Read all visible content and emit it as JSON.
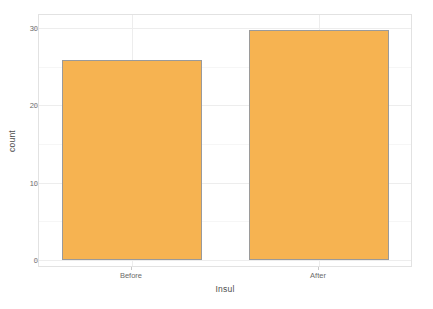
{
  "chart_data": {
    "type": "bar",
    "title": "",
    "subtitle": "",
    "xlabel": "Insul",
    "ylabel": "count",
    "categories": [
      "Before",
      "After"
    ],
    "values": [
      26,
      30
    ],
    "series": [
      {
        "name": "count",
        "values": [
          26,
          30
        ]
      }
    ],
    "ylim": [
      0,
      31
    ],
    "yticks": [
      0,
      10,
      20,
      30
    ],
    "ytick_labels": [
      "0",
      "10",
      "20",
      "30"
    ],
    "xtick_labels": [
      "Before",
      "After"
    ],
    "grid": true,
    "grid_axis": "both",
    "legend": "none",
    "bar_fill_color": "#F6B351",
    "bar_border_color": "#9A9A9A",
    "panel_background": "#FFFFFF",
    "panel_border_color": "#E2E2E2",
    "gridline_color": "#EDEDED",
    "axis_text_color": "#6B6B6B",
    "axis_title_color": "#4D4D4D"
  },
  "axes": {
    "y": {
      "title": "count",
      "ticks": [
        {
          "label": "30",
          "value": 30
        },
        {
          "label": "20",
          "value": 20
        },
        {
          "label": "10",
          "value": 10
        },
        {
          "label": "0",
          "value": 0
        }
      ]
    },
    "x": {
      "title": "Insul",
      "ticks": [
        {
          "label": "Before"
        },
        {
          "label": "After"
        }
      ]
    }
  }
}
